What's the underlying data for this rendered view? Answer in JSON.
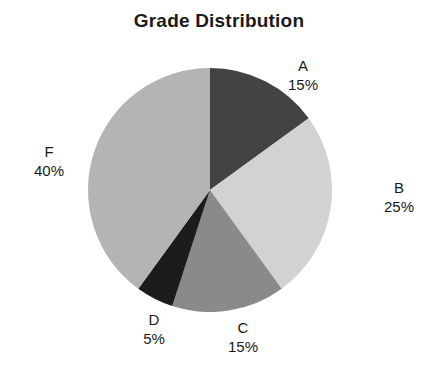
{
  "chart_data": {
    "type": "pie",
    "title": "Grade Distribution",
    "xlabel": "",
    "ylabel": "",
    "legend_position": "none",
    "grid": false,
    "start_angle_deg": 90,
    "direction": "clockwise",
    "categories": [
      "A",
      "B",
      "C",
      "D",
      "F"
    ],
    "values": [
      15,
      25,
      15,
      5,
      40
    ],
    "value_unit": "%",
    "labels": [
      {
        "name": "A",
        "value": "15%",
        "color": "#434343"
      },
      {
        "name": "B",
        "value": "25%",
        "color": "#d2d2d2"
      },
      {
        "name": "C",
        "value": "15%",
        "color": "#8a8a8a"
      },
      {
        "name": "D",
        "value": "5%",
        "color": "#1c1c1c"
      },
      {
        "name": "F",
        "value": "40%",
        "color": "#b4b4b4"
      }
    ],
    "slice_colors": [
      "#434343",
      "#d2d2d2",
      "#8a8a8a",
      "#1c1c1c",
      "#b4b4b4"
    ],
    "background_color": "#ffffff",
    "text_color": "#1a1a1a"
  }
}
